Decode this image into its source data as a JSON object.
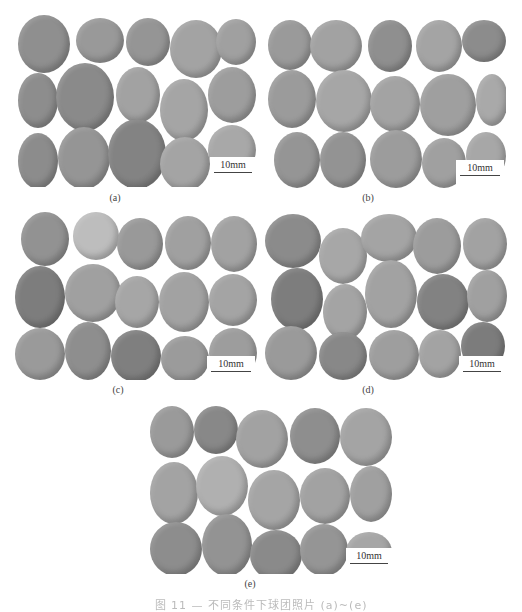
{
  "figure": {
    "panels": [
      {
        "id": "a",
        "label": "(a)",
        "scale_bar": "10mm",
        "box": {
          "x": 18,
          "y": 15,
          "w": 238,
          "h": 172
        },
        "label_pos": {
          "x": 115,
          "y": 192
        },
        "pellets": [
          {
            "x": 0,
            "y": 0,
            "w": 52,
            "h": 58,
            "c": "#8f8f8f"
          },
          {
            "x": 58,
            "y": 3,
            "w": 48,
            "h": 45,
            "c": "#999999"
          },
          {
            "x": 108,
            "y": 3,
            "w": 44,
            "h": 48,
            "c": "#959595"
          },
          {
            "x": 152,
            "y": 5,
            "w": 52,
            "h": 58,
            "c": "#a3a3a3"
          },
          {
            "x": 198,
            "y": 4,
            "w": 40,
            "h": 46,
            "c": "#a0a0a0"
          },
          {
            "x": 0,
            "y": 58,
            "w": 40,
            "h": 55,
            "c": "#8d8d8d"
          },
          {
            "x": 38,
            "y": 48,
            "w": 58,
            "h": 68,
            "c": "#8a8a8a"
          },
          {
            "x": 98,
            "y": 52,
            "w": 44,
            "h": 56,
            "c": "#a2a2a2"
          },
          {
            "x": 142,
            "y": 64,
            "w": 48,
            "h": 62,
            "c": "#a5a5a5"
          },
          {
            "x": 190,
            "y": 52,
            "w": 48,
            "h": 56,
            "c": "#9d9d9d"
          },
          {
            "x": 0,
            "y": 118,
            "w": 40,
            "h": 56,
            "c": "#8c8c8c"
          },
          {
            "x": 40,
            "y": 112,
            "w": 52,
            "h": 62,
            "c": "#959595"
          },
          {
            "x": 90,
            "y": 104,
            "w": 58,
            "h": 70,
            "c": "#838383"
          },
          {
            "x": 142,
            "y": 122,
            "w": 50,
            "h": 54,
            "c": "#a4a4a4"
          },
          {
            "x": 190,
            "y": 110,
            "w": 48,
            "h": 50,
            "c": "#a8a8a8"
          }
        ],
        "scale_box": {
          "x": 192,
          "y": 142,
          "w": 46,
          "h": 22
        }
      },
      {
        "id": "b",
        "label": "(b)",
        "scale_bar": "10mm",
        "box": {
          "x": 268,
          "y": 20,
          "w": 238,
          "h": 168
        },
        "label_pos": {
          "x": 368,
          "y": 192
        },
        "pellets": [
          {
            "x": 0,
            "y": 0,
            "w": 44,
            "h": 50,
            "c": "#9a9a9a"
          },
          {
            "x": 42,
            "y": 0,
            "w": 52,
            "h": 52,
            "c": "#a2a2a2"
          },
          {
            "x": 100,
            "y": 0,
            "w": 44,
            "h": 52,
            "c": "#8f8f8f"
          },
          {
            "x": 148,
            "y": 0,
            "w": 46,
            "h": 52,
            "c": "#a4a4a4"
          },
          {
            "x": 194,
            "y": 0,
            "w": 44,
            "h": 42,
            "c": "#8c8c8c"
          },
          {
            "x": 0,
            "y": 50,
            "w": 48,
            "h": 58,
            "c": "#9b9b9b"
          },
          {
            "x": 48,
            "y": 50,
            "w": 56,
            "h": 62,
            "c": "#a6a6a6"
          },
          {
            "x": 102,
            "y": 56,
            "w": 50,
            "h": 56,
            "c": "#a3a3a3"
          },
          {
            "x": 152,
            "y": 54,
            "w": 56,
            "h": 62,
            "c": "#9f9f9f"
          },
          {
            "x": 208,
            "y": 54,
            "w": 32,
            "h": 52,
            "c": "#a9a9a9"
          },
          {
            "x": 6,
            "y": 112,
            "w": 46,
            "h": 56,
            "c": "#959595"
          },
          {
            "x": 52,
            "y": 112,
            "w": 46,
            "h": 56,
            "c": "#939393"
          },
          {
            "x": 102,
            "y": 110,
            "w": 52,
            "h": 58,
            "c": "#9c9c9c"
          },
          {
            "x": 154,
            "y": 118,
            "w": 44,
            "h": 50,
            "c": "#a0a0a0"
          },
          {
            "x": 198,
            "y": 112,
            "w": 40,
            "h": 48,
            "c": "#a7a7a7"
          }
        ],
        "scale_box": {
          "x": 188,
          "y": 140,
          "w": 48,
          "h": 22
        }
      },
      {
        "id": "c",
        "label": "(c)",
        "scale_bar": "10mm",
        "box": {
          "x": 15,
          "y": 212,
          "w": 242,
          "h": 168
        },
        "label_pos": {
          "x": 118,
          "y": 384
        },
        "pellets": [
          {
            "x": 6,
            "y": 0,
            "w": 48,
            "h": 54,
            "c": "#929292"
          },
          {
            "x": 58,
            "y": 0,
            "w": 46,
            "h": 48,
            "c": "#bdbdbd"
          },
          {
            "x": 102,
            "y": 6,
            "w": 46,
            "h": 52,
            "c": "#999999"
          },
          {
            "x": 150,
            "y": 4,
            "w": 46,
            "h": 54,
            "c": "#a0a0a0"
          },
          {
            "x": 196,
            "y": 4,
            "w": 46,
            "h": 56,
            "c": "#a2a2a2"
          },
          {
            "x": 0,
            "y": 54,
            "w": 50,
            "h": 62,
            "c": "#7d7d7d"
          },
          {
            "x": 50,
            "y": 52,
            "w": 56,
            "h": 58,
            "c": "#a0a0a0"
          },
          {
            "x": 100,
            "y": 64,
            "w": 44,
            "h": 52,
            "c": "#a6a6a6"
          },
          {
            "x": 144,
            "y": 60,
            "w": 50,
            "h": 60,
            "c": "#a2a2a2"
          },
          {
            "x": 194,
            "y": 62,
            "w": 48,
            "h": 52,
            "c": "#a4a4a4"
          },
          {
            "x": 0,
            "y": 116,
            "w": 50,
            "h": 52,
            "c": "#9a9a9a"
          },
          {
            "x": 50,
            "y": 110,
            "w": 46,
            "h": 58,
            "c": "#8e8e8e"
          },
          {
            "x": 96,
            "y": 118,
            "w": 50,
            "h": 52,
            "c": "#7f7f7f"
          },
          {
            "x": 146,
            "y": 124,
            "w": 48,
            "h": 46,
            "c": "#9b9b9b"
          },
          {
            "x": 194,
            "y": 116,
            "w": 48,
            "h": 50,
            "c": "#9d9d9d"
          }
        ],
        "scale_box": {
          "x": 192,
          "y": 144,
          "w": 48,
          "h": 22
        }
      },
      {
        "id": "d",
        "label": "(d)",
        "scale_bar": "10mm",
        "box": {
          "x": 265,
          "y": 214,
          "w": 242,
          "h": 166
        },
        "label_pos": {
          "x": 368,
          "y": 384
        },
        "pellets": [
          {
            "x": 0,
            "y": 0,
            "w": 56,
            "h": 54,
            "c": "#8b8b8b"
          },
          {
            "x": 54,
            "y": 14,
            "w": 48,
            "h": 56,
            "c": "#a7a7a7"
          },
          {
            "x": 96,
            "y": 0,
            "w": 56,
            "h": 48,
            "c": "#a4a4a4"
          },
          {
            "x": 148,
            "y": 4,
            "w": 48,
            "h": 56,
            "c": "#9c9c9c"
          },
          {
            "x": 198,
            "y": 4,
            "w": 44,
            "h": 52,
            "c": "#a2a2a2"
          },
          {
            "x": 6,
            "y": 54,
            "w": 52,
            "h": 62,
            "c": "#7d7d7d"
          },
          {
            "x": 58,
            "y": 70,
            "w": 44,
            "h": 56,
            "c": "#a4a4a4"
          },
          {
            "x": 100,
            "y": 46,
            "w": 52,
            "h": 68,
            "c": "#a2a2a2"
          },
          {
            "x": 152,
            "y": 60,
            "w": 52,
            "h": 56,
            "c": "#828282"
          },
          {
            "x": 202,
            "y": 56,
            "w": 40,
            "h": 52,
            "c": "#a0a0a0"
          },
          {
            "x": 0,
            "y": 112,
            "w": 52,
            "h": 54,
            "c": "#9a9a9a"
          },
          {
            "x": 54,
            "y": 118,
            "w": 48,
            "h": 48,
            "c": "#888888"
          },
          {
            "x": 104,
            "y": 116,
            "w": 50,
            "h": 50,
            "c": "#9e9e9e"
          },
          {
            "x": 154,
            "y": 116,
            "w": 42,
            "h": 48,
            "c": "#a3a3a3"
          },
          {
            "x": 196,
            "y": 108,
            "w": 44,
            "h": 48,
            "c": "#7c7c7c"
          }
        ],
        "scale_box": {
          "x": 194,
          "y": 142,
          "w": 46,
          "h": 22
        }
      },
      {
        "id": "e",
        "label": "(e)",
        "scale_bar": "10mm",
        "box": {
          "x": 150,
          "y": 406,
          "w": 242,
          "h": 168
        },
        "label_pos": {
          "x": 250,
          "y": 578
        },
        "pellets": [
          {
            "x": 0,
            "y": 0,
            "w": 44,
            "h": 52,
            "c": "#9a9a9a"
          },
          {
            "x": 44,
            "y": 0,
            "w": 44,
            "h": 48,
            "c": "#888888"
          },
          {
            "x": 86,
            "y": 4,
            "w": 52,
            "h": 58,
            "c": "#a2a2a2"
          },
          {
            "x": 140,
            "y": 2,
            "w": 50,
            "h": 56,
            "c": "#8e8e8e"
          },
          {
            "x": 190,
            "y": 2,
            "w": 52,
            "h": 58,
            "c": "#a4a4a4"
          },
          {
            "x": 0,
            "y": 56,
            "w": 48,
            "h": 62,
            "c": "#a3a3a3"
          },
          {
            "x": 46,
            "y": 50,
            "w": 52,
            "h": 60,
            "c": "#b0b0b0"
          },
          {
            "x": 98,
            "y": 64,
            "w": 52,
            "h": 60,
            "c": "#a5a5a5"
          },
          {
            "x": 150,
            "y": 62,
            "w": 50,
            "h": 56,
            "c": "#a2a2a2"
          },
          {
            "x": 200,
            "y": 60,
            "w": 42,
            "h": 56,
            "c": "#a0a0a0"
          },
          {
            "x": 0,
            "y": 116,
            "w": 52,
            "h": 54,
            "c": "#8d8d8d"
          },
          {
            "x": 52,
            "y": 108,
            "w": 50,
            "h": 62,
            "c": "#939393"
          },
          {
            "x": 100,
            "y": 124,
            "w": 52,
            "h": 50,
            "c": "#8a8a8a"
          },
          {
            "x": 150,
            "y": 118,
            "w": 48,
            "h": 52,
            "c": "#959595"
          },
          {
            "x": 196,
            "y": 126,
            "w": 46,
            "h": 40,
            "c": "#a6a6a6"
          }
        ],
        "scale_box": {
          "x": 196,
          "y": 142,
          "w": 46,
          "h": 22
        }
      }
    ],
    "caption": "图 11 — 不同条件下球团照片 (a)~(e)"
  }
}
